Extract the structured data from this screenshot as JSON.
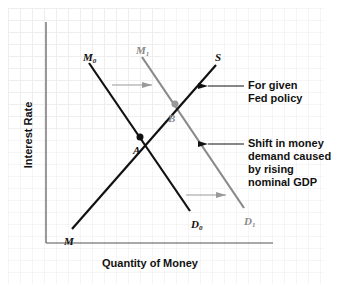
{
  "diagram": {
    "axes": {
      "x_label": "Quantity of Money",
      "y_label": "Interest Rate"
    },
    "curves": {
      "supply": {
        "label": "S",
        "start_label": "M",
        "color": "#111111"
      },
      "demand_original": {
        "top_label": "M",
        "top_sub": "0",
        "bottom_label": "D",
        "bottom_sub": "0",
        "color": "#111111"
      },
      "demand_shifted": {
        "top_label": "M",
        "top_sub": "1",
        "bottom_label": "D",
        "bottom_sub": "1",
        "color": "#8a8a8a"
      }
    },
    "points": {
      "a": {
        "label": "A",
        "color": "#111111"
      },
      "b": {
        "label": "B",
        "color": "#8a8a8a"
      }
    },
    "annotations": {
      "fed_policy": [
        "For given",
        "Fed policy"
      ],
      "shift": [
        "Shift in money",
        "demand caused",
        "by rising",
        "nominal GDP"
      ]
    },
    "colors": {
      "grid": "#ececec",
      "axis": "#555555",
      "shift_arrow": "#999999"
    }
  }
}
